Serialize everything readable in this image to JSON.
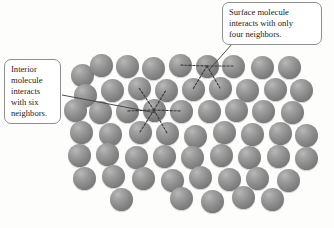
{
  "figure": {
    "background_color": "#fdfdfc",
    "molecule_color": "#8d8d8d",
    "bond_color": "#3a3a3a",
    "leader_color": "#3a3a3a",
    "callout_border_color": "#8e8e8e"
  },
  "callouts": {
    "surface": {
      "text": "Surface molecule\ninteracts with only\nfour neighbors.",
      "neighbor_count": 4,
      "type": "surface"
    },
    "interior": {
      "text": "Interior\nmolecule\ninteracts\nwith six\nneighbors.",
      "neighbor_count": 6,
      "type": "interior"
    }
  },
  "molecules": [
    {
      "x": 82,
      "y": 75,
      "row": 0,
      "role": "normal"
    },
    {
      "x": 101,
      "y": 65,
      "row": 0,
      "role": "normal"
    },
    {
      "x": 127,
      "y": 66,
      "row": 0,
      "role": "normal"
    },
    {
      "x": 153,
      "y": 68,
      "row": 0,
      "role": "normal"
    },
    {
      "x": 180,
      "y": 65,
      "row": 0,
      "role": "normal"
    },
    {
      "x": 207,
      "y": 66,
      "row": 0,
      "role": "surface-highlight"
    },
    {
      "x": 233,
      "y": 66,
      "row": 0,
      "role": "normal"
    },
    {
      "x": 262,
      "y": 67,
      "row": 0,
      "role": "normal"
    },
    {
      "x": 289,
      "y": 67,
      "row": 0,
      "role": "normal"
    },
    {
      "x": 85,
      "y": 95,
      "row": 1,
      "role": "normal"
    },
    {
      "x": 112,
      "y": 90,
      "row": 1,
      "role": "normal"
    },
    {
      "x": 139,
      "y": 88,
      "row": 1,
      "role": "normal"
    },
    {
      "x": 166,
      "y": 90,
      "row": 1,
      "role": "normal"
    },
    {
      "x": 193,
      "y": 89,
      "row": 1,
      "role": "normal"
    },
    {
      "x": 220,
      "y": 88,
      "row": 1,
      "role": "normal"
    },
    {
      "x": 247,
      "y": 90,
      "row": 1,
      "role": "normal"
    },
    {
      "x": 275,
      "y": 89,
      "row": 1,
      "role": "normal"
    },
    {
      "x": 301,
      "y": 90,
      "row": 1,
      "role": "normal"
    },
    {
      "x": 75,
      "y": 110,
      "row": 2,
      "role": "normal"
    },
    {
      "x": 100,
      "y": 112,
      "row": 2,
      "role": "normal"
    },
    {
      "x": 127,
      "y": 111,
      "row": 2,
      "role": "normal"
    },
    {
      "x": 154,
      "y": 110,
      "row": 2,
      "role": "interior-highlight"
    },
    {
      "x": 181,
      "y": 111,
      "row": 2,
      "role": "normal"
    },
    {
      "x": 209,
      "y": 111,
      "row": 2,
      "role": "normal"
    },
    {
      "x": 236,
      "y": 110,
      "row": 2,
      "role": "normal"
    },
    {
      "x": 263,
      "y": 111,
      "row": 2,
      "role": "normal"
    },
    {
      "x": 292,
      "y": 112,
      "row": 2,
      "role": "normal"
    },
    {
      "x": 81,
      "y": 132,
      "row": 3,
      "role": "normal"
    },
    {
      "x": 110,
      "y": 134,
      "row": 3,
      "role": "normal"
    },
    {
      "x": 140,
      "y": 132,
      "row": 3,
      "role": "normal"
    },
    {
      "x": 167,
      "y": 133,
      "row": 3,
      "role": "normal"
    },
    {
      "x": 195,
      "y": 136,
      "row": 3,
      "role": "normal"
    },
    {
      "x": 224,
      "y": 132,
      "row": 3,
      "role": "normal"
    },
    {
      "x": 252,
      "y": 134,
      "row": 3,
      "role": "normal"
    },
    {
      "x": 280,
      "y": 133,
      "row": 3,
      "role": "normal"
    },
    {
      "x": 306,
      "y": 135,
      "row": 3,
      "role": "normal"
    },
    {
      "x": 79,
      "y": 155,
      "row": 4,
      "role": "normal"
    },
    {
      "x": 107,
      "y": 154,
      "row": 4,
      "role": "normal"
    },
    {
      "x": 136,
      "y": 157,
      "row": 4,
      "role": "normal"
    },
    {
      "x": 164,
      "y": 156,
      "row": 4,
      "role": "normal"
    },
    {
      "x": 192,
      "y": 157,
      "row": 4,
      "role": "normal"
    },
    {
      "x": 221,
      "y": 155,
      "row": 4,
      "role": "normal"
    },
    {
      "x": 249,
      "y": 157,
      "row": 4,
      "role": "normal"
    },
    {
      "x": 278,
      "y": 156,
      "row": 4,
      "role": "normal"
    },
    {
      "x": 306,
      "y": 158,
      "row": 4,
      "role": "normal"
    },
    {
      "x": 84,
      "y": 178,
      "row": 5,
      "role": "normal"
    },
    {
      "x": 113,
      "y": 176,
      "row": 5,
      "role": "normal"
    },
    {
      "x": 143,
      "y": 178,
      "row": 5,
      "role": "normal"
    },
    {
      "x": 172,
      "y": 180,
      "row": 5,
      "role": "normal"
    },
    {
      "x": 200,
      "y": 177,
      "row": 5,
      "role": "normal"
    },
    {
      "x": 229,
      "y": 179,
      "row": 5,
      "role": "normal"
    },
    {
      "x": 257,
      "y": 178,
      "row": 5,
      "role": "normal"
    },
    {
      "x": 288,
      "y": 180,
      "row": 5,
      "role": "normal"
    },
    {
      "x": 121,
      "y": 199,
      "row": 6,
      "role": "normal"
    },
    {
      "x": 181,
      "y": 198,
      "row": 6,
      "role": "normal"
    },
    {
      "x": 212,
      "y": 201,
      "row": 6,
      "role": "normal"
    },
    {
      "x": 243,
      "y": 197,
      "row": 6,
      "role": "normal"
    },
    {
      "x": 272,
      "y": 199,
      "row": 6,
      "role": "normal"
    }
  ],
  "bonds": [
    {
      "from": [
        207,
        66
      ],
      "to": [
        180,
        65
      ],
      "group": "surface"
    },
    {
      "from": [
        207,
        66
      ],
      "to": [
        233,
        66
      ],
      "group": "surface"
    },
    {
      "from": [
        207,
        66
      ],
      "to": [
        193,
        89
      ],
      "group": "surface"
    },
    {
      "from": [
        207,
        66
      ],
      "to": [
        220,
        88
      ],
      "group": "surface"
    },
    {
      "from": [
        154,
        110
      ],
      "to": [
        127,
        111
      ],
      "group": "interior"
    },
    {
      "from": [
        154,
        110
      ],
      "to": [
        181,
        111
      ],
      "group": "interior"
    },
    {
      "from": [
        154,
        110
      ],
      "to": [
        139,
        88
      ],
      "group": "interior"
    },
    {
      "from": [
        154,
        110
      ],
      "to": [
        166,
        90
      ],
      "group": "interior"
    },
    {
      "from": [
        154,
        110
      ],
      "to": [
        140,
        132
      ],
      "group": "interior"
    },
    {
      "from": [
        154,
        110
      ],
      "to": [
        167,
        133
      ],
      "group": "interior"
    }
  ],
  "leader_lines": [
    {
      "name": "surface-leader",
      "from": [
        232,
        44
      ],
      "to": [
        209,
        70
      ]
    },
    {
      "name": "interior-leader",
      "from": [
        62,
        95
      ],
      "to": [
        156,
        113
      ]
    }
  ]
}
